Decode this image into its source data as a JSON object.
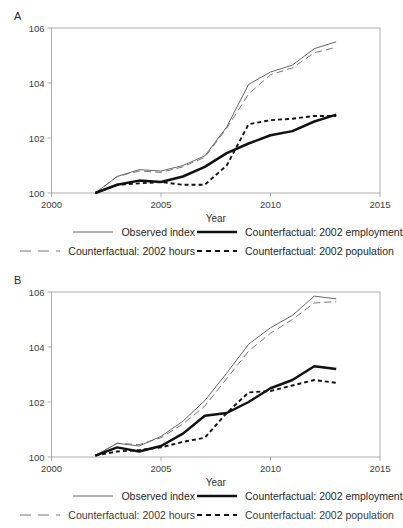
{
  "figure": {
    "axis_label_x": "Year",
    "xticks": [
      2000,
      2005,
      2010,
      2015
    ],
    "yticks": [
      100,
      102,
      104,
      106
    ]
  },
  "legend": {
    "observed": "Observed index",
    "employment": "Counterfactual: 2002 employment",
    "hours": "Counterfactual: 2002 hours",
    "population": "Counterfactual: 2002 population"
  },
  "panels": [
    {
      "letter": "A"
    },
    {
      "letter": "B"
    }
  ],
  "chart_data": [
    {
      "type": "line",
      "panel": "A",
      "title": "",
      "xlabel": "Year",
      "ylabel": "",
      "xlim": [
        2000,
        2015
      ],
      "ylim": [
        100,
        106
      ],
      "grid": false,
      "legend_position": "below",
      "x": [
        2002,
        2003,
        2004,
        2005,
        2006,
        2007,
        2008,
        2009,
        2010,
        2011,
        2012,
        2013
      ],
      "series": [
        {
          "name": "Observed index",
          "style": "thin-solid",
          "values": [
            100.0,
            100.6,
            100.85,
            100.8,
            101.0,
            101.35,
            102.4,
            103.95,
            104.4,
            104.65,
            105.25,
            105.5
          ]
        },
        {
          "name": "Counterfactual: 2002 hours",
          "style": "long-dash",
          "values": [
            100.0,
            100.6,
            100.8,
            100.75,
            100.95,
            101.3,
            102.35,
            103.6,
            104.3,
            104.55,
            105.1,
            105.3
          ]
        },
        {
          "name": "Counterfactual: 2002 employment",
          "style": "thick-solid",
          "values": [
            100.0,
            100.3,
            100.45,
            100.4,
            100.6,
            100.95,
            101.45,
            101.8,
            102.1,
            102.25,
            102.6,
            102.85
          ]
        },
        {
          "name": "Counterfactual: 2002 population",
          "style": "short-dash",
          "values": [
            100.0,
            100.3,
            100.35,
            100.4,
            100.3,
            100.3,
            101.0,
            102.5,
            102.65,
            102.7,
            102.8,
            102.8
          ]
        }
      ]
    },
    {
      "type": "line",
      "panel": "B",
      "title": "",
      "xlabel": "Year",
      "ylabel": "",
      "xlim": [
        2000,
        2015
      ],
      "ylim": [
        100,
        106
      ],
      "grid": false,
      "legend_position": "below",
      "x": [
        2002,
        2003,
        2004,
        2005,
        2006,
        2007,
        2008,
        2009,
        2010,
        2011,
        2012,
        2013
      ],
      "series": [
        {
          "name": "Observed index",
          "style": "thin-solid",
          "values": [
            100.05,
            100.5,
            100.4,
            100.75,
            101.3,
            102.05,
            103.05,
            104.1,
            104.7,
            105.15,
            105.85,
            105.75
          ]
        },
        {
          "name": "Counterfactual: 2002 hours",
          "style": "long-dash",
          "values": [
            100.05,
            100.5,
            100.45,
            100.7,
            101.2,
            101.85,
            102.85,
            103.85,
            104.5,
            105.0,
            105.6,
            105.65
          ]
        },
        {
          "name": "Counterfactual: 2002 employment",
          "style": "thick-solid",
          "values": [
            100.05,
            100.35,
            100.2,
            100.4,
            100.85,
            101.5,
            101.6,
            102.0,
            102.5,
            102.8,
            103.3,
            103.2
          ]
        },
        {
          "name": "Counterfactual: 2002 population",
          "style": "short-dash",
          "values": [
            100.05,
            100.2,
            100.25,
            100.35,
            100.55,
            100.7,
            101.6,
            102.35,
            102.4,
            102.6,
            102.8,
            102.7
          ]
        }
      ]
    }
  ]
}
